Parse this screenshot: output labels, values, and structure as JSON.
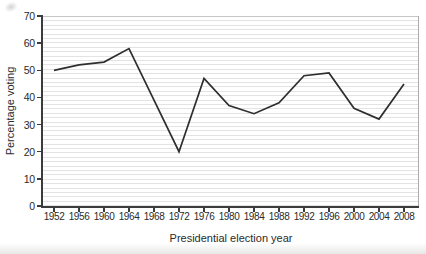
{
  "chart_data": {
    "type": "line",
    "title": "",
    "xlabel": "Presidential election year",
    "ylabel": "Percentage voting",
    "x": [
      1952,
      1956,
      1960,
      1964,
      1968,
      1972,
      1976,
      1980,
      1984,
      1988,
      1992,
      1996,
      2000,
      2004,
      2008
    ],
    "series": [
      {
        "name": "Percentage voting",
        "values": [
          50,
          52,
          53,
          58,
          39,
          20,
          47,
          37,
          34,
          38,
          48,
          49,
          36,
          32,
          45
        ]
      }
    ],
    "ylim": [
      0,
      70
    ],
    "yticks": [
      0,
      10,
      20,
      30,
      40,
      50,
      60,
      70
    ],
    "x_tick_step_years": 4,
    "grid": "fine horizontal ruling inside plot area",
    "legend": "none",
    "line_color": "#2e2e2e",
    "axis_color": "#3c3c3c",
    "text_color": "#2b2b2b"
  }
}
